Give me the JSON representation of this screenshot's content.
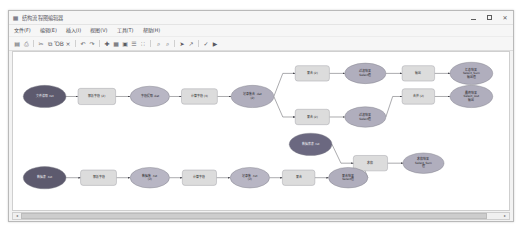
{
  "window": {
    "title": "结构流程图编辑器",
    "icon": "diagram-icon",
    "minimize_label": "最小化",
    "maximize_label": "最大化",
    "close_label": "关闭"
  },
  "menu": {
    "items": [
      {
        "name": "file",
        "label": "文件(F)"
      },
      {
        "name": "edit",
        "label": "编辑(E)"
      },
      {
        "name": "insert",
        "label": "插入(I)"
      },
      {
        "name": "view",
        "label": "视图(V)"
      },
      {
        "name": "tools",
        "label": "工具(T)"
      },
      {
        "name": "help",
        "label": "帮助(H)"
      }
    ]
  },
  "toolbar": {
    "buttons": [
      {
        "name": "save",
        "icon": "save-icon",
        "glyph": "▤",
        "label": "保存"
      },
      {
        "name": "print",
        "icon": "print-icon",
        "glyph": "⎙",
        "label": "打印"
      },
      {
        "name": "cut",
        "icon": "cut-icon",
        "glyph": "✂",
        "label": "剪切"
      },
      {
        "name": "copy",
        "icon": "copy-icon",
        "glyph": "⧉",
        "label": "复制"
      },
      {
        "name": "paste",
        "icon": "paste-icon",
        "glyph": "ὌB",
        "label": "粘贴"
      },
      {
        "name": "delete",
        "icon": "close-icon",
        "glyph": "×",
        "label": "删除"
      },
      {
        "name": "undo",
        "icon": "undo-icon",
        "glyph": "↶",
        "label": "撤销"
      },
      {
        "name": "redo",
        "icon": "redo-icon",
        "glyph": "↷",
        "label": "重做"
      },
      {
        "name": "add-node",
        "icon": "plus-icon",
        "glyph": "✚",
        "label": "添加节点"
      },
      {
        "name": "grid",
        "icon": "grid-icon",
        "glyph": "▦",
        "label": "网格"
      },
      {
        "name": "align",
        "icon": "align-icon",
        "glyph": "▣",
        "label": "对齐"
      },
      {
        "name": "distribute",
        "icon": "distribute-icon",
        "glyph": "☰",
        "label": "分布"
      },
      {
        "name": "layout",
        "icon": "layout-icon",
        "glyph": "∷",
        "label": "布局"
      },
      {
        "name": "zoom-in",
        "icon": "zoom-in-icon",
        "glyph": "⌕",
        "label": "放大"
      },
      {
        "name": "zoom-out",
        "icon": "zoom-out-icon",
        "glyph": "⌕",
        "label": "缩小"
      },
      {
        "name": "pointer",
        "icon": "cursor-icon",
        "glyph": "➤",
        "label": "选择"
      },
      {
        "name": "connector",
        "icon": "connector-icon",
        "glyph": "↗",
        "label": "连线"
      },
      {
        "name": "validate",
        "icon": "check-icon",
        "glyph": "✓",
        "label": "校验"
      },
      {
        "name": "run",
        "icon": "play-icon",
        "glyph": "▶",
        "label": "运行"
      }
    ]
  },
  "graph": {
    "nodes": [
      {
        "id": "n1",
        "name": "node-start-a",
        "shape": "ellipse",
        "fill": "#5d5a6e",
        "text_color": "light",
        "x": 37,
        "y": 52,
        "rx": 25,
        "ry": 13,
        "lines": [
          "文件读取 .txt"
        ]
      },
      {
        "id": "n2",
        "name": "node-parse-a",
        "shape": "rect",
        "fill": "#dcdcdc",
        "text_color": "dark",
        "x": 98,
        "y": 52,
        "w": 44,
        "h": 19,
        "lines": [
          "解析字段 (2)"
        ]
      },
      {
        "id": "n3",
        "name": "node-field-a",
        "shape": "ellipse",
        "fill": "#b8b6c4",
        "text_color": "dark",
        "x": 160,
        "y": 52,
        "rx": 23,
        "ry": 12,
        "lines": [
          "字段提取 .dat"
        ]
      },
      {
        "id": "n4",
        "name": "node-convert-a",
        "shape": "rect",
        "fill": "#dcdcdc",
        "text_color": "dark",
        "x": 218,
        "y": 52,
        "w": 42,
        "h": 18,
        "lines": [
          "计算字段 (3)"
        ]
      },
      {
        "id": "n5",
        "name": "node-hub-a",
        "shape": "ellipse",
        "fill": "#b0aebd",
        "text_color": "dark",
        "x": 280,
        "y": 52,
        "rx": 25,
        "ry": 13,
        "lines": [
          "记录集合 .dat",
          "(2)"
        ]
      },
      {
        "id": "n6",
        "name": "node-merge-top",
        "shape": "rect",
        "fill": "#dcdcdc",
        "text_color": "dark",
        "x": 350,
        "y": 25,
        "w": 40,
        "h": 18,
        "lines": [
          "聚合 (2)"
        ]
      },
      {
        "id": "n7",
        "name": "node-select-top",
        "shape": "ellipse",
        "fill": "#b0aebd",
        "text_color": "dark",
        "x": 412,
        "y": 25,
        "rx": 24,
        "ry": 12,
        "lines": [
          "过滤结果",
          "Select值"
        ]
      },
      {
        "id": "n8",
        "name": "node-output-top",
        "shape": "rect",
        "fill": "#dcdcdc",
        "text_color": "dark",
        "x": 474,
        "y": 25,
        "w": 38,
        "h": 18,
        "lines": [
          "输出"
        ]
      },
      {
        "id": "n9",
        "name": "node-result-top",
        "shape": "ellipse",
        "fill": "#b0aebd",
        "text_color": "dark",
        "x": 536,
        "y": 25,
        "rx": 25,
        "ry": 13,
        "lines": [
          "汇总结果",
          "Select_Sum",
          "输出值"
        ]
      },
      {
        "id": "n10",
        "name": "node-merge-mid",
        "shape": "rect",
        "fill": "#dcdcdc",
        "text_color": "dark",
        "x": 350,
        "y": 76,
        "w": 40,
        "h": 18,
        "lines": [
          "聚合 (2)"
        ]
      },
      {
        "id": "n11",
        "name": "node-select-mid",
        "shape": "ellipse",
        "fill": "#b0aebd",
        "text_color": "dark",
        "x": 412,
        "y": 76,
        "rx": 24,
        "ry": 12,
        "lines": [
          "过滤结果",
          "Select值"
        ]
      },
      {
        "id": "n12",
        "name": "node-join",
        "shape": "rect",
        "fill": "#dcdcdc",
        "text_color": "dark",
        "x": 474,
        "y": 52,
        "w": 38,
        "h": 18,
        "lines": [
          "合并 (2)"
        ]
      },
      {
        "id": "n13",
        "name": "node-final",
        "shape": "ellipse",
        "fill": "#b0aebd",
        "text_color": "dark",
        "x": 536,
        "y": 52,
        "rx": 25,
        "ry": 13,
        "lines": [
          "最终结果",
          "Select_Out",
          "输出"
        ]
      },
      {
        "id": "n14",
        "name": "node-branch-dark",
        "shape": "ellipse",
        "fill": "#6b6880",
        "text_color": "light",
        "x": 348,
        "y": 108,
        "rx": 25,
        "ry": 13,
        "lines": [
          "数据库表 .txt"
        ]
      },
      {
        "id": "n15",
        "name": "node-sum",
        "shape": "rect",
        "fill": "#dcdcdc",
        "text_color": "dark",
        "x": 418,
        "y": 130,
        "w": 40,
        "h": 18,
        "lines": [
          "求和"
        ]
      },
      {
        "id": "n16",
        "name": "node-sum-result",
        "shape": "ellipse",
        "fill": "#b0aebd",
        "text_color": "dark",
        "x": 480,
        "y": 130,
        "rx": 24,
        "ry": 12,
        "lines": [
          "求和结果",
          "Select_Sum",
          "值"
        ]
      },
      {
        "id": "n17",
        "name": "node-start-b",
        "shape": "ellipse",
        "fill": "#5d5a6e",
        "text_color": "light",
        "x": 37,
        "y": 147,
        "rx": 25,
        "ry": 13,
        "lines": [
          "数据表 .txt"
        ]
      },
      {
        "id": "n18",
        "name": "node-parse-b",
        "shape": "rect",
        "fill": "#dcdcdc",
        "text_color": "dark",
        "x": 100,
        "y": 147,
        "w": 42,
        "h": 18,
        "lines": [
          "解析字段"
        ]
      },
      {
        "id": "n19",
        "name": "node-field-b",
        "shape": "ellipse",
        "fill": "#b8b6c4",
        "text_color": "dark",
        "x": 160,
        "y": 147,
        "rx": 23,
        "ry": 12,
        "lines": [
          "数据集 .txt",
          "(2)"
        ]
      },
      {
        "id": "n20",
        "name": "node-convert-b",
        "shape": "rect",
        "fill": "#dcdcdc",
        "text_color": "dark",
        "x": 218,
        "y": 147,
        "w": 40,
        "h": 18,
        "lines": [
          "计算字段"
        ]
      },
      {
        "id": "n21",
        "name": "node-hub-b",
        "shape": "ellipse",
        "fill": "#b8b6c4",
        "text_color": "dark",
        "x": 277,
        "y": 147,
        "rx": 23,
        "ry": 12,
        "lines": [
          "记录集 .txt",
          "(2)"
        ]
      },
      {
        "id": "n22",
        "name": "node-agg-b",
        "shape": "rect",
        "fill": "#dcdcdc",
        "text_color": "dark",
        "x": 334,
        "y": 147,
        "w": 38,
        "h": 18,
        "lines": [
          "聚合"
        ]
      },
      {
        "id": "n23",
        "name": "node-result-b",
        "shape": "ellipse",
        "fill": "#b0aebd",
        "text_color": "dark",
        "x": 392,
        "y": 147,
        "rx": 23,
        "ry": 12,
        "lines": [
          "聚合结果",
          "Select值"
        ]
      }
    ],
    "edges": [
      {
        "name": "edge-n1-n2",
        "from": "n1",
        "to": "n2"
      },
      {
        "name": "edge-n2-n3",
        "from": "n2",
        "to": "n3"
      },
      {
        "name": "edge-n3-n4",
        "from": "n3",
        "to": "n4"
      },
      {
        "name": "edge-n4-n5",
        "from": "n4",
        "to": "n5"
      },
      {
        "name": "edge-n5-n6",
        "from": "n5",
        "to": "n6"
      },
      {
        "name": "edge-n6-n7",
        "from": "n6",
        "to": "n7"
      },
      {
        "name": "edge-n7-n8",
        "from": "n7",
        "to": "n8"
      },
      {
        "name": "edge-n8-n9",
        "from": "n8",
        "to": "n9"
      },
      {
        "name": "edge-n5-n10",
        "from": "n5",
        "to": "n10"
      },
      {
        "name": "edge-n10-n11",
        "from": "n10",
        "to": "n11"
      },
      {
        "name": "edge-n11-n12",
        "from": "n11",
        "to": "n12"
      },
      {
        "name": "edge-n12-n13",
        "from": "n12",
        "to": "n13"
      },
      {
        "name": "edge-n14-n15",
        "from": "n14",
        "to": "n15"
      },
      {
        "name": "edge-n15-n16",
        "from": "n15",
        "to": "n16"
      },
      {
        "name": "edge-n17-n18",
        "from": "n17",
        "to": "n18"
      },
      {
        "name": "edge-n18-n19",
        "from": "n18",
        "to": "n19"
      },
      {
        "name": "edge-n19-n20",
        "from": "n19",
        "to": "n20"
      },
      {
        "name": "edge-n20-n21",
        "from": "n20",
        "to": "n21"
      },
      {
        "name": "edge-n21-n22",
        "from": "n21",
        "to": "n22"
      },
      {
        "name": "edge-n22-n23",
        "from": "n22",
        "to": "n23"
      },
      {
        "name": "edge-n23-n15",
        "from": "n23",
        "to": "n15"
      }
    ]
  },
  "scrollbar": {
    "left_arrow": "◂",
    "right_arrow": "▸",
    "thumb_left_pct": 0,
    "thumb_width_pct": 97
  }
}
